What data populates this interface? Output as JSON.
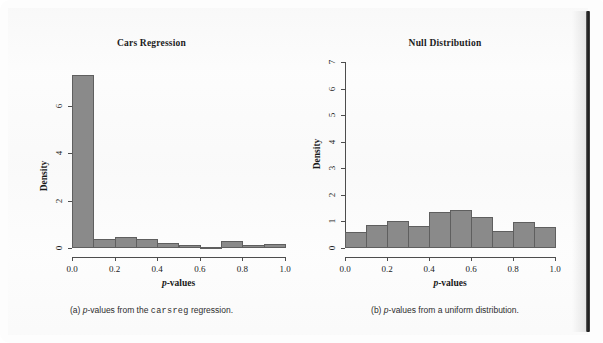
{
  "page": {
    "background_color": "#fdfdfd",
    "spine_color": "#1d1d1d"
  },
  "figures": [
    {
      "id": "fig-a",
      "caption_prefix": "(a)",
      "caption_part1": "p",
      "caption_part2": "-values from the ",
      "caption_code": "carsreg",
      "caption_part3": " regression."
    },
    {
      "id": "fig-b",
      "caption_prefix": "(b)",
      "caption_part1": "p",
      "caption_part2": "-values from a uniform distribution.",
      "caption_code": "",
      "caption_part3": ""
    }
  ],
  "chart_data": [
    {
      "type": "bar",
      "id": "cars-regression",
      "title": "Cars Regression",
      "xlabel_italic": "p",
      "xlabel_rest": "-values",
      "ylabel": "Density",
      "categories": [
        "0.0-0.1",
        "0.1-0.2",
        "0.2-0.3",
        "0.3-0.4",
        "0.4-0.5",
        "0.5-0.6",
        "0.6-0.7",
        "0.7-0.8",
        "0.8-0.9",
        "0.9-1.0"
      ],
      "bin_edges": [
        0.0,
        0.1,
        0.2,
        0.3,
        0.4,
        0.5,
        0.6,
        0.7,
        0.8,
        0.9,
        1.0
      ],
      "values": [
        7.32,
        0.38,
        0.48,
        0.38,
        0.22,
        0.14,
        0.05,
        0.3,
        0.12,
        0.18
      ],
      "xlim": [
        0.0,
        1.0
      ],
      "ylim": [
        0,
        7.6
      ],
      "xticks": [
        0.0,
        0.2,
        0.4,
        0.6,
        0.8,
        1.0
      ],
      "xtick_labels": [
        "0.0",
        "0.2",
        "0.4",
        "0.6",
        "0.8",
        "1.0"
      ],
      "yticks": [
        0,
        2,
        4,
        6
      ],
      "ytick_labels": [
        "0",
        "2",
        "4",
        "6"
      ],
      "bar_fill": "#8a8a8a",
      "bar_edge": "#5f5f5f",
      "grid": false,
      "legend": null
    },
    {
      "type": "bar",
      "id": "null-distribution",
      "title": "Null Distribution",
      "xlabel_italic": "p",
      "xlabel_rest": "-values",
      "ylabel": "Density",
      "categories": [
        "0.0-0.1",
        "0.1-0.2",
        "0.2-0.3",
        "0.3-0.4",
        "0.4-0.5",
        "0.5-0.6",
        "0.6-0.7",
        "0.7-0.8",
        "0.8-0.9",
        "0.9-1.0"
      ],
      "bin_edges": [
        0.0,
        0.1,
        0.2,
        0.3,
        0.4,
        0.5,
        0.6,
        0.7,
        0.8,
        0.9,
        1.0
      ],
      "values": [
        0.6,
        0.85,
        1.0,
        0.82,
        1.35,
        1.43,
        1.17,
        0.63,
        0.97,
        0.78
      ],
      "xlim": [
        0.0,
        1.0
      ],
      "ylim": [
        0,
        7.0
      ],
      "xticks": [
        0.0,
        0.2,
        0.4,
        0.6,
        0.8,
        1.0
      ],
      "xtick_labels": [
        "0.0",
        "0.2",
        "0.4",
        "0.6",
        "0.8",
        "1.0"
      ],
      "yticks": [
        0,
        1,
        2,
        3,
        4,
        5,
        6,
        7
      ],
      "ytick_labels": [
        "0",
        "1",
        "2",
        "3",
        "4",
        "5",
        "6",
        "7"
      ],
      "bar_fill": "#8a8a8a",
      "bar_edge": "#5f5f5f",
      "grid": false,
      "legend": null
    }
  ]
}
